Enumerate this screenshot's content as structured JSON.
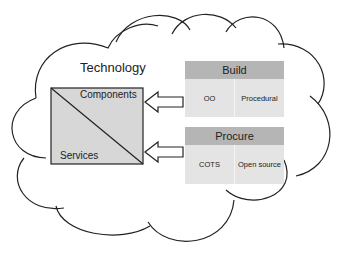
{
  "diagram": {
    "cloud_label": "Technology",
    "box": {
      "top_label": "Components",
      "bottom_label": "Services",
      "fill": "#d7d7d7"
    },
    "panels": [
      {
        "title": "Build",
        "items": [
          "OO",
          "Procedural"
        ]
      },
      {
        "title": "Procure",
        "items": [
          "COTS",
          "Open source"
        ]
      }
    ],
    "arrows": [
      {
        "from": "Build",
        "to": "Components"
      },
      {
        "from": "Procure",
        "to": "Services"
      }
    ],
    "colors": {
      "header": "#b5b5b5",
      "body": "#e4e4e4",
      "stroke": "#222222"
    }
  }
}
